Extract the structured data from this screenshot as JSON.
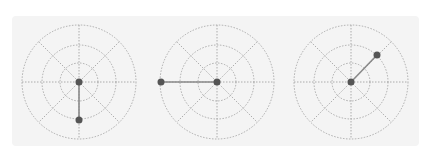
{
  "figure": {
    "colors": {
      "background": "#ffffff",
      "panel": "#f4f4f4",
      "grid": "#9a9a9a",
      "stick": "#8a8a8a",
      "dot": "#555555"
    },
    "grid": {
      "rings": [
        19,
        37,
        57
      ],
      "spokes_deg": [
        0,
        45,
        90,
        135
      ]
    },
    "dials": [
      {
        "id": "dial-1",
        "cx": 79,
        "cy": 82,
        "handle": {
          "x": 79,
          "y": 120
        },
        "direction": "down"
      },
      {
        "id": "dial-2",
        "cx": 217,
        "cy": 82,
        "handle": {
          "x": 161,
          "y": 82
        },
        "direction": "left"
      },
      {
        "id": "dial-3",
        "cx": 351,
        "cy": 82,
        "handle": {
          "x": 377,
          "y": 55
        },
        "direction": "up-right"
      }
    ]
  }
}
